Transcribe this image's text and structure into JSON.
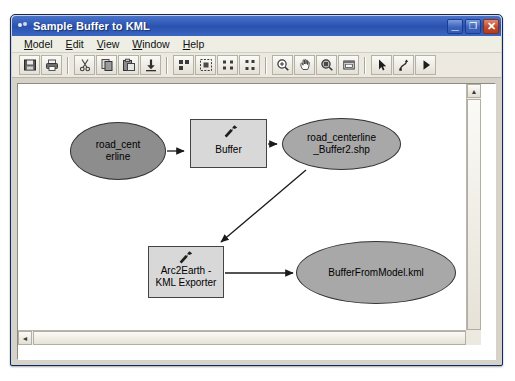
{
  "window": {
    "title": "Sample Buffer to KML",
    "icon": "model-icon",
    "controls": {
      "minimize": "_",
      "maximize": "❐",
      "close": "✕"
    }
  },
  "menubar": {
    "items": [
      {
        "label": "Model",
        "accel": "M"
      },
      {
        "label": "Edit",
        "accel": "E"
      },
      {
        "label": "View",
        "accel": "V"
      },
      {
        "label": "Window",
        "accel": "W"
      },
      {
        "label": "Help",
        "accel": "H"
      }
    ]
  },
  "toolbar": {
    "groups": [
      {
        "buttons": [
          {
            "name": "save-icon",
            "title": "Save"
          },
          {
            "name": "print-icon",
            "title": "Print"
          }
        ]
      },
      {
        "buttons": [
          {
            "name": "cut-icon",
            "title": "Cut"
          },
          {
            "name": "copy-icon",
            "title": "Copy"
          },
          {
            "name": "paste-icon",
            "title": "Paste"
          },
          {
            "name": "add-data-icon",
            "title": "Add Data"
          }
        ]
      },
      {
        "buttons": [
          {
            "name": "auto-layout-icon",
            "title": "Auto Layout"
          },
          {
            "name": "fit-page-icon",
            "title": "Fit To Page"
          },
          {
            "name": "diagram-properties-icon",
            "title": "Diagram Properties"
          },
          {
            "name": "model-properties-icon",
            "title": "Model Properties"
          }
        ]
      },
      {
        "buttons": [
          {
            "name": "zoom-in-icon",
            "title": "Zoom In"
          },
          {
            "name": "pan-icon",
            "title": "Pan"
          },
          {
            "name": "zoom-selected-icon",
            "title": "Zoom To Selected"
          },
          {
            "name": "full-extent-icon",
            "title": "Full Extent"
          }
        ]
      },
      {
        "buttons": [
          {
            "name": "select-arrow-icon",
            "title": "Select"
          },
          {
            "name": "connect-icon",
            "title": "Connect"
          },
          {
            "name": "run-icon",
            "title": "Run"
          }
        ]
      }
    ]
  },
  "diagram": {
    "nodes": [
      {
        "id": "road-centerline-input",
        "type": "input-data",
        "shape": "ellipse",
        "label": "road_cent\nerline",
        "label_line1": "road_cent",
        "label_line2": "erline",
        "fill": "#8d8d8d",
        "x": 52,
        "y": 38,
        "w": 96,
        "h": 58
      },
      {
        "id": "buffer-tool",
        "type": "tool",
        "shape": "rectangle",
        "label": "Buffer",
        "fill": "#d8d8d8",
        "icon": "hammer-icon",
        "x": 172,
        "y": 35,
        "w": 77,
        "h": 49
      },
      {
        "id": "road-centerline-buffer2-shp",
        "type": "derived-data",
        "shape": "ellipse",
        "label": "road_centerline\n_Buffer2.shp",
        "label_line1": "road_centerline",
        "label_line2": "_Buffer2.shp",
        "fill": "#a8a8a8",
        "x": 264,
        "y": 34,
        "w": 119,
        "h": 52
      },
      {
        "id": "arc2earth-kml-exporter",
        "type": "tool",
        "shape": "rectangle",
        "label": "Arc2Earth -\nKML Exporter",
        "label_line1": "Arc2Earth -",
        "label_line2": "KML Exporter",
        "fill": "#d8d8d8",
        "icon": "hammer-icon",
        "x": 130,
        "y": 162,
        "w": 76,
        "h": 52
      },
      {
        "id": "bufferfrommodel-kml",
        "type": "derived-data",
        "shape": "ellipse",
        "label": "BufferFromModel.kml",
        "fill": "#a8a8a8",
        "x": 278,
        "y": 157,
        "w": 160,
        "h": 63
      }
    ],
    "links": [
      {
        "from": "road-centerline-input",
        "to": "buffer-tool"
      },
      {
        "from": "buffer-tool",
        "to": "road-centerline-buffer2-shp"
      },
      {
        "from": "road-centerline-buffer2-shp",
        "to": "arc2earth-kml-exporter"
      },
      {
        "from": "arc2earth-kml-exporter",
        "to": "bufferfrommodel-kml"
      }
    ]
  },
  "scrollbars": {
    "vertical": {
      "up": "▲",
      "down": "▼"
    },
    "horizontal": {
      "left": "◄",
      "right": "►"
    }
  }
}
